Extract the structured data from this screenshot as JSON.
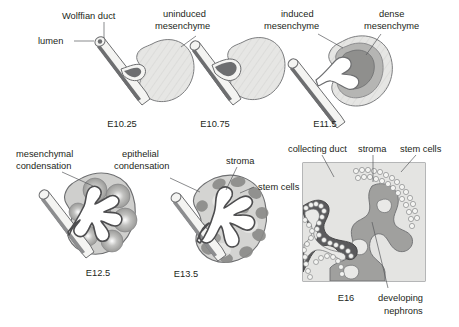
{
  "figure": {
    "background_color": "#ffffff",
    "ink_color": "#231f20",
    "leader_color": "#58595b"
  },
  "palette": {
    "uninduced_mesenchyme": "#e3e3e1",
    "induced_mesenchyme": "#b9b9b7",
    "dense_mesenchyme": "#8f8f8d",
    "duct_wall": "#f2f2f0",
    "duct_lumen": "#6d6e70",
    "stroma": "#d6d6d4",
    "stem_cells": "#8a8a88",
    "collecting_duct_dark": "#4d4d4f",
    "nephron_gray": "#a0a09e",
    "outline": "#58595b"
  },
  "panels": [
    {
      "id": "e1025",
      "stage": "E10.25",
      "labels": [
        {
          "name": "wolffian-duct",
          "text": "Wolffian duct"
        },
        {
          "name": "lumen",
          "text": "lumen"
        },
        {
          "name": "uninduced-mesenchyme",
          "text_line1": "uninduced",
          "text_line2": "mesenchyme"
        }
      ]
    },
    {
      "id": "e1075",
      "stage": "E10.75",
      "labels": []
    },
    {
      "id": "e115",
      "stage": "E11.5",
      "labels": [
        {
          "name": "induced-mesenchyme",
          "text_line1": "induced",
          "text_line2": "mesenchyme"
        },
        {
          "name": "dense-mesenchyme",
          "text_line1": "dense",
          "text_line2": "mesenchyme"
        }
      ]
    },
    {
      "id": "e125",
      "stage": "E12.5",
      "labels": [
        {
          "name": "mesenchymal-condensation",
          "text_line1": "mesenchymal",
          "text_line2": "condensation"
        }
      ]
    },
    {
      "id": "e135",
      "stage": "E13.5",
      "labels": [
        {
          "name": "epithelial-condensation",
          "text_line1": "epithelial",
          "text_line2": "condensation"
        },
        {
          "name": "stroma",
          "text": "stroma"
        },
        {
          "name": "stem-cells",
          "text": "stem cells"
        }
      ]
    },
    {
      "id": "e16",
      "stage": "E16",
      "labels": [
        {
          "name": "collecting-duct",
          "text": "collecting duct"
        },
        {
          "name": "stroma",
          "text": "stroma"
        },
        {
          "name": "stem-cells",
          "text": "stem cells"
        },
        {
          "name": "developing-nephrons",
          "text_line1": "developing",
          "text_line2": "nephrons"
        }
      ]
    }
  ],
  "text": {
    "wolffian_duct": "Wolffian duct",
    "lumen": "lumen",
    "uninduced_1": "uninduced",
    "uninduced_2": "mesenchyme",
    "induced_1": "induced",
    "induced_2": "mesenchyme",
    "dense_1": "dense",
    "dense_2": "mesenchyme",
    "mesenchymal_1": "mesenchymal",
    "mesenchymal_2": "condensation",
    "epithelial_1": "epithelial",
    "epithelial_2": "condensation",
    "stroma_mid": "stroma",
    "stem_cells_mid": "stem cells",
    "collecting_duct": "collecting duct",
    "stroma_right": "stroma",
    "stem_cells_right": "stem cells",
    "developing_1": "developing",
    "developing_2": "nephrons",
    "stage_e1025": "E10.25",
    "stage_e1075": "E10.75",
    "stage_e115": "E11.5",
    "stage_e125": "E12.5",
    "stage_e135": "E13.5",
    "stage_e16": "E16"
  }
}
